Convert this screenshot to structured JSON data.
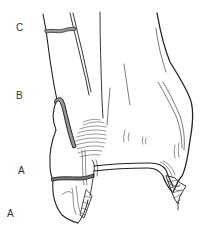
{
  "figure": {
    "panel_label": "A",
    "fracture_levels": [
      {
        "id": "C",
        "label": "C",
        "position": "above syndesmosis"
      },
      {
        "id": "B",
        "label": "B",
        "position": "at level of syndesmosis"
      },
      {
        "id": "A",
        "label": "A",
        "position": "below syndesmosis"
      }
    ],
    "colors": {
      "line": "#222222",
      "fracture_band": "#9a9a9a",
      "background": "#ffffff"
    }
  }
}
